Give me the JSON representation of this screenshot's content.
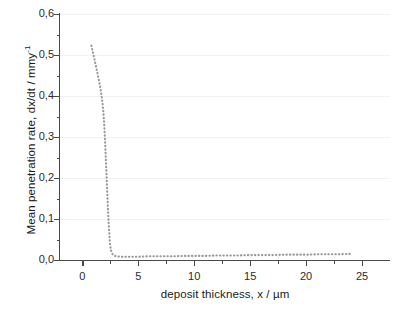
{
  "chart_data": {
    "type": "line",
    "title": "",
    "xlabel": "deposit thickness, x / µm",
    "ylabel_text": "Mean penetration rate, dx/dt / mmy",
    "ylabel_sup": "-1",
    "xlim": [
      -2.0,
      27.5
    ],
    "ylim": [
      0.0,
      0.6
    ],
    "xticks": [
      0,
      5,
      10,
      15,
      20,
      25
    ],
    "xtick_labels": [
      "0",
      "5",
      "10",
      "15",
      "20",
      "25"
    ],
    "xticks_minor": [
      2.5,
      7.5,
      12.5,
      17.5,
      22.5
    ],
    "yticks": [
      0.0,
      0.1,
      0.2,
      0.3,
      0.4,
      0.5,
      0.6
    ],
    "ytick_labels": [
      "0,0",
      "0,1",
      "0,2",
      "0,3",
      "0,4",
      "0,5",
      "0,6"
    ],
    "yticks_minor": [
      0.05,
      0.15,
      0.25,
      0.35,
      0.45,
      0.55
    ],
    "grid": "horizontal-major-only",
    "grid_color": "#f2f2f2",
    "legend": "none",
    "series": [
      {
        "name": "mean penetration rate",
        "style": "dotted",
        "color": "#999999",
        "x": [
          0.8,
          0.95,
          1.1,
          1.2,
          1.3,
          1.4,
          1.5,
          1.6,
          1.7,
          1.8,
          1.85,
          1.9,
          1.95,
          2.0,
          2.05,
          2.1,
          2.15,
          2.2,
          2.25,
          2.3,
          2.35,
          2.4,
          2.45,
          2.5,
          2.6,
          2.75,
          3.0,
          3.5,
          4.0,
          5.0,
          6.0,
          7.0,
          8.0,
          9.0,
          10.0,
          11.0,
          12.0,
          13.0,
          14.0,
          15.0,
          16.0,
          17.0,
          18.0,
          19.0,
          20.0,
          21.0,
          22.0,
          23.0,
          24.0
        ],
        "y": [
          0.523,
          0.505,
          0.487,
          0.475,
          0.462,
          0.449,
          0.436,
          0.421,
          0.404,
          0.383,
          0.369,
          0.352,
          0.331,
          0.305,
          0.276,
          0.245,
          0.212,
          0.179,
          0.148,
          0.119,
          0.092,
          0.068,
          0.048,
          0.033,
          0.019,
          0.012,
          0.009,
          0.008,
          0.008,
          0.008,
          0.009,
          0.009,
          0.009,
          0.01,
          0.01,
          0.01,
          0.011,
          0.011,
          0.011,
          0.012,
          0.012,
          0.012,
          0.013,
          0.013,
          0.013,
          0.014,
          0.014,
          0.014,
          0.015
        ]
      }
    ]
  },
  "axes": {
    "axis_color": "#4a4a4a"
  }
}
